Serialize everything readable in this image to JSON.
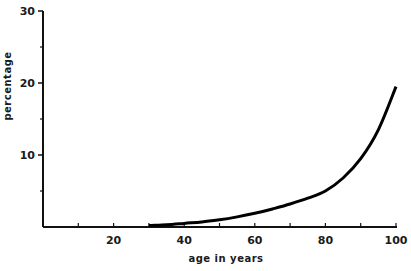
{
  "chart_data": {
    "type": "line",
    "title": "",
    "xlabel": "age in years",
    "ylabel": "percentage",
    "xlim": [
      0,
      100
    ],
    "ylim": [
      0,
      30
    ],
    "xticks": [
      20,
      40,
      60,
      80,
      100
    ],
    "xticks_minor": [
      10,
      30,
      50,
      70,
      90
    ],
    "yticks": [
      10,
      20,
      30
    ],
    "yticks_minor": [
      5,
      15,
      25
    ],
    "grid": false,
    "legend": null,
    "series": [
      {
        "name": "percentage",
        "x": [
          30,
          35,
          40,
          45,
          50,
          55,
          60,
          65,
          70,
          75,
          80,
          85,
          90,
          95,
          100
        ],
        "y": [
          0.2,
          0.3,
          0.5,
          0.7,
          1.0,
          1.4,
          1.9,
          2.5,
          3.2,
          4.0,
          5.0,
          6.8,
          9.5,
          13.5,
          19.5
        ]
      }
    ]
  }
}
